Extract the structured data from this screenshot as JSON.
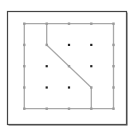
{
  "figure": {
    "frame": {
      "x": 7.5,
      "y": 11.5,
      "width": 119,
      "height": 113,
      "stroke": "#444444"
    },
    "grid": {
      "cols": 5,
      "rows": 5,
      "x": [
        24.3,
        46.7,
        69,
        91.3,
        113.5
      ],
      "y": [
        23.7,
        44.9,
        66.2,
        87.5,
        108.7
      ],
      "boundary_dot_color": "#9a9a9a",
      "interior_dot_color": "#222222",
      "line_color": "#a8a8a8"
    },
    "square": [
      [
        0,
        0
      ],
      [
        4,
        0
      ],
      [
        4,
        4
      ],
      [
        0,
        4
      ]
    ],
    "path": [
      [
        1,
        0
      ],
      [
        1,
        1
      ],
      [
        3,
        3
      ],
      [
        3,
        4
      ]
    ],
    "interior_dots": [
      [
        2,
        1
      ],
      [
        3,
        1
      ],
      [
        1,
        2
      ],
      [
        3,
        2
      ],
      [
        1,
        3
      ],
      [
        2,
        3
      ]
    ]
  }
}
